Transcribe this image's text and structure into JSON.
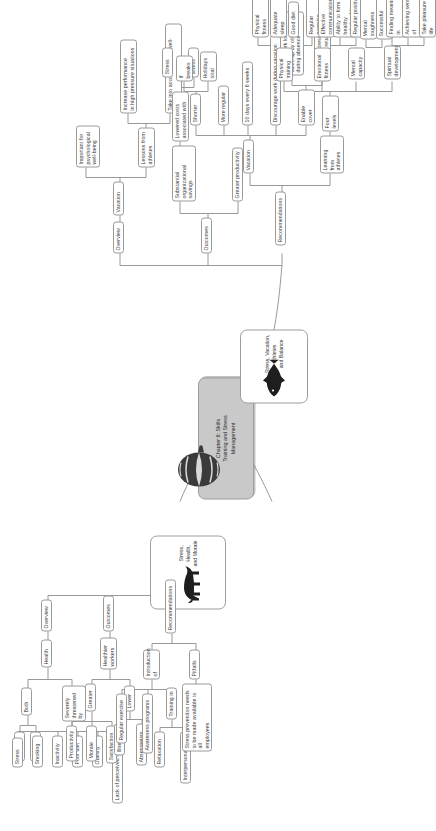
{
  "document": {
    "type": "mind-map",
    "orientation": "rotated-90-counterclockwise",
    "background_color": "#ffffff",
    "line_color": "#8d8d8d",
    "topic_fill": "#c9c9c9"
  },
  "central_topic": {
    "label": "Chapter 8: Skills\nTraining and Stress\nManagement",
    "icon": "spiral-shell-icon"
  },
  "main_topics": [
    {
      "id": "stress-health-morale",
      "label": "Stress,\nHealth,\nand Morale",
      "image": "bull-silhouette-image"
    },
    {
      "id": "stress-vacation-athletes-balance",
      "label": "Stress, Vacation,\nAthletes\nand Balance",
      "image": "fish-silhouette-image"
    }
  ],
  "branch_health": {
    "overview": {
      "label": "Overview",
      "children": [
        {
          "label": "Health",
          "children": [
            {
              "label": "Both",
              "children": [
                {
                  "label": "Physical"
                },
                {
                  "label": "Mental"
                }
              ]
            },
            {
              "label": "Severely\nthreatened by",
              "children": [
                {
                  "label": "Stress"
                },
                {
                  "label": "Smoking"
                },
                {
                  "label": "Inactivity"
                },
                {
                  "label": "Poor diet"
                },
                {
                  "label": "Obesity"
                },
                {
                  "label": "Lack of perceived control"
                }
              ]
            }
          ]
        }
      ]
    },
    "outcomes": {
      "label": "Outcomes",
      "children": [
        {
          "label": "Healthier\nworkers",
          "children": [
            {
              "label": "Greater",
              "children": [
                {
                  "label": "Productivity"
                },
                {
                  "label": "Morale"
                },
                {
                  "label": "Satisfaction"
                }
              ]
            },
            {
              "label": "Lower",
              "children": [
                {
                  "label": "Illness"
                },
                {
                  "label": "Absenteeism"
                }
              ]
            }
          ]
        }
      ]
    },
    "recommendations": {
      "label": "Recommendations",
      "children": [
        {
          "label": "Introduction\nof",
          "children": [
            {
              "label": "Regular exercise"
            },
            {
              "label": "Awareness programs"
            },
            {
              "label": "Training in",
              "children": [
                {
                  "label": "Relaxation"
                },
                {
                  "label": "Interpersonal skills"
                }
              ]
            }
          ]
        },
        {
          "label": "Pitfalls",
          "children": [
            {
              "label": "Stress prevention needs\nto be made available to all\nemployees"
            }
          ]
        }
      ]
    }
  },
  "branch_vacation": {
    "overview": {
      "label": "Overview",
      "children": [
        {
          "label": "Vacation",
          "children": [
            {
              "label": "Important for\npsychological\nwell-being"
            },
            {
              "label": "Lessons from\nathletes",
              "children": [
                {
                  "label": "Increase performance\nin high pressure situations"
                },
                {
                  "label": "Take into account overall well-being"
                }
              ]
            }
          ]
        }
      ]
    },
    "outcomes": {
      "label": "Outcomes",
      "children": [
        {
          "label": "Substantial\norganizational savings",
          "children": [
            {
              "label": "Lowered costs\nassociated with",
              "children": [
                {
                  "label": "Stress"
                },
                {
                  "label": "Illness"
                }
              ]
            }
          ]
        },
        {
          "label": "Greater productivity"
        }
      ]
    },
    "recommendations": {
      "label": "Recommendations",
      "children": [
        {
          "label": "Vacation",
          "children": [
            {
              "label": "Shorter",
              "children": [
                {
                  "label": "If\nbreaks"
                },
                {
                  "label": "Holidays\ntotal"
                }
              ]
            },
            {
              "label": "More regular"
            },
            {
              "label": "10 days every 6 weeks"
            },
            {
              "label": "Discourage work during vacation"
            },
            {
              "label": "Enable\ncover",
              "children": [
                {
                  "label": "So that work load is\ntaken up by others\nduring absence"
                },
                {
                  "label": "Reduces stress of work\nwaiting on return"
                }
              ]
            }
          ]
        },
        {
          "label": "Learning\nfrom\nathletes",
          "children": [
            {
              "label": "Four\nlevels",
              "children": [
                {
                  "label": "Physical\ntraining",
                  "children": [
                    {
                      "label": "Physical fitness"
                    },
                    {
                      "label": "Adequate sleep"
                    },
                    {
                      "label": "Good diet"
                    },
                    {
                      "label": "Regular exercise"
                    }
                  ]
                },
                {
                  "label": "Emotional\nfitness",
                  "children": [
                    {
                      "label": "Effective communication"
                    },
                    {
                      "label": "Ability to form healthy\nrelationships"
                    },
                    {
                      "label": "Regular positive emotions"
                    }
                  ]
                },
                {
                  "label": "Mental\ncapacity",
                  "children": [
                    {
                      "label": "Mental toughness"
                    },
                    {
                      "label": "Successful visualisation"
                    }
                  ]
                },
                {
                  "label": "Spiritual\ndevelopment",
                  "children": [
                    {
                      "label": "Finding meaning in\neveryday life"
                    },
                    {
                      "label": "Achieving sense of\npurpose"
                    },
                    {
                      "label": "Take pleasure from life"
                    }
                  ]
                }
              ]
            }
          ]
        }
      ]
    }
  }
}
